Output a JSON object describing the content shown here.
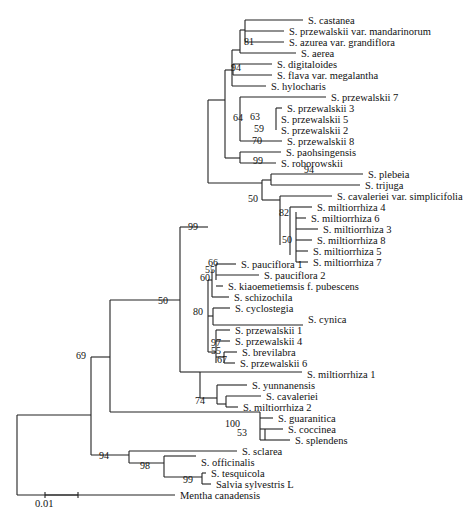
{
  "figure": {
    "type": "phylogenetic-tree",
    "scale_bar": {
      "label": "0.01",
      "x1": 45,
      "x2": 78,
      "y": 495
    }
  },
  "taxa": [
    {
      "name": "S. castanea",
      "x": 306,
      "y": 20
    },
    {
      "name": "S. przewalskii var. mandarinorum",
      "x": 287,
      "y": 31
    },
    {
      "name": "S. azurea var. grandiflora",
      "x": 287,
      "y": 42
    },
    {
      "name": "S. aerea",
      "x": 299,
      "y": 53
    },
    {
      "name": "S. digitaloides",
      "x": 275,
      "y": 64
    },
    {
      "name": "S. flava var. megalantha",
      "x": 275,
      "y": 75
    },
    {
      "name": "S. hylocharis",
      "x": 269,
      "y": 86
    },
    {
      "name": "S. przewalskii 7",
      "x": 329,
      "y": 97
    },
    {
      "name": "S. przewalskii 3",
      "x": 285,
      "y": 108
    },
    {
      "name": "S. przewalskii 5",
      "x": 279,
      "y": 119
    },
    {
      "name": "S. przewalskii 2",
      "x": 279,
      "y": 130
    },
    {
      "name": "S. przewalskii 8",
      "x": 285,
      "y": 141
    },
    {
      "name": "S. paohsingensis",
      "x": 284,
      "y": 152
    },
    {
      "name": "S. roborowskii",
      "x": 279,
      "y": 163
    },
    {
      "name": "S. plebeia",
      "x": 366,
      "y": 174
    },
    {
      "name": "S. trijuga",
      "x": 363,
      "y": 185
    },
    {
      "name": "S. cavaleriei var. simplicifolia",
      "x": 335,
      "y": 196
    },
    {
      "name": "S. miltiorrhiza 4",
      "x": 315,
      "y": 207
    },
    {
      "name": "S. miltiorrhiza 6",
      "x": 309,
      "y": 218
    },
    {
      "name": "S. miltiorrhiza 3",
      "x": 321,
      "y": 229
    },
    {
      "name": "S. miltiorrhiza 8",
      "x": 315,
      "y": 240
    },
    {
      "name": "S. miltiorrhiza 5",
      "x": 311,
      "y": 251
    },
    {
      "name": "S. miltiorrhiza 7",
      "x": 311,
      "y": 262
    },
    {
      "name": "S. pauciflora 1",
      "x": 239,
      "y": 264
    },
    {
      "name": "S. pauciflora 2",
      "x": 262,
      "y": 275
    },
    {
      "name": "S. kiaoemetiemsis f. pubescens",
      "x": 226,
      "y": 286
    },
    {
      "name": "S. schizochila",
      "x": 232,
      "y": 297
    },
    {
      "name": "S. cyclostegia",
      "x": 233,
      "y": 308
    },
    {
      "name": "S. cynica",
      "x": 306,
      "y": 319
    },
    {
      "name": "S. przewalskii 1",
      "x": 233,
      "y": 330
    },
    {
      "name": "S. przewalskii 4",
      "x": 233,
      "y": 341
    },
    {
      "name": "S. brevilabra",
      "x": 240,
      "y": 352
    },
    {
      "name": "S. przewalskii 6",
      "x": 238,
      "y": 363
    },
    {
      "name": "S. miltiorrhiza 1",
      "x": 305,
      "y": 374
    },
    {
      "name": "S. yunnanensis",
      "x": 250,
      "y": 385
    },
    {
      "name": "S. cavaleriei",
      "x": 264,
      "y": 396
    },
    {
      "name": "S. miltiorrhiza 2",
      "x": 241,
      "y": 407
    },
    {
      "name": "S. guaranitica",
      "x": 276,
      "y": 418
    },
    {
      "name": "S. coccinea",
      "x": 286,
      "y": 429
    },
    {
      "name": "S. splendens",
      "x": 293,
      "y": 440
    },
    {
      "name": "S. sclarea",
      "x": 240,
      "y": 451
    },
    {
      "name": "S. officinalis",
      "x": 199,
      "y": 462
    },
    {
      "name": "S. tesquicola",
      "x": 209,
      "y": 473
    },
    {
      "name": "Salvia sylvestris L",
      "x": 214,
      "y": 484
    },
    {
      "name": "Mentha canadensis",
      "x": 178,
      "y": 495
    }
  ],
  "bootstrap": [
    {
      "value": "81",
      "x": 254,
      "y": 42
    },
    {
      "value": "94",
      "x": 241,
      "y": 68
    },
    {
      "value": "64",
      "x": 243,
      "y": 118
    },
    {
      "value": "63",
      "x": 260,
      "y": 117
    },
    {
      "value": "59",
      "x": 264,
      "y": 129
    },
    {
      "value": "70",
      "x": 262,
      "y": 141
    },
    {
      "value": "99",
      "x": 263,
      "y": 161
    },
    {
      "value": "94",
      "x": 314,
      "y": 170
    },
    {
      "value": "50",
      "x": 258,
      "y": 199
    },
    {
      "value": "82",
      "x": 289,
      "y": 213
    },
    {
      "value": "50",
      "x": 292,
      "y": 240
    },
    {
      "value": "99",
      "x": 198,
      "y": 227
    },
    {
      "value": "66",
      "x": 218,
      "y": 263
    },
    {
      "value": "55",
      "x": 215,
      "y": 270
    },
    {
      "value": "60",
      "x": 210,
      "y": 278
    },
    {
      "value": "80",
      "x": 203,
      "y": 312
    },
    {
      "value": "97",
      "x": 221,
      "y": 343
    },
    {
      "value": "55",
      "x": 221,
      "y": 351
    },
    {
      "value": "67",
      "x": 227,
      "y": 360
    },
    {
      "value": "50",
      "x": 168,
      "y": 301
    },
    {
      "value": "69",
      "x": 86,
      "y": 356
    },
    {
      "value": "74",
      "x": 205,
      "y": 401
    },
    {
      "value": "100",
      "x": 240,
      "y": 424
    },
    {
      "value": "53",
      "x": 247,
      "y": 433
    },
    {
      "value": "94",
      "x": 109,
      "y": 456
    },
    {
      "value": "98",
      "x": 150,
      "y": 466
    },
    {
      "value": "99",
      "x": 193,
      "y": 480
    }
  ],
  "branches": [
    [
      17,
      415,
      17,
      495
    ],
    [
      17,
      495,
      175,
      495
    ],
    [
      17,
      415,
      91,
      415
    ],
    [
      91,
      357,
      91,
      455
    ],
    [
      91,
      357,
      110,
      357
    ],
    [
      110,
      300,
      110,
      412
    ],
    [
      110,
      300,
      180,
      300
    ],
    [
      180,
      227,
      180,
      372
    ],
    [
      180,
      227,
      208,
      227
    ],
    [
      208,
      100,
      208,
      183
    ],
    [
      208,
      100,
      225,
      100
    ],
    [
      208,
      183,
      262,
      183
    ],
    [
      225,
      70,
      225,
      158
    ],
    [
      225,
      70,
      232,
      70
    ],
    [
      225,
      158,
      240,
      158
    ],
    [
      232,
      50,
      232,
      86
    ],
    [
      232,
      86,
      266,
      86
    ],
    [
      232,
      50,
      240,
      50
    ],
    [
      240,
      30,
      240,
      53
    ],
    [
      240,
      53,
      296,
      53
    ],
    [
      240,
      30,
      245,
      30
    ],
    [
      245,
      20,
      245,
      42
    ],
    [
      245,
      20,
      303,
      20
    ],
    [
      245,
      31,
      284,
      31
    ],
    [
      245,
      42,
      284,
      42
    ],
    [
      233,
      64,
      233,
      75
    ],
    [
      233,
      64,
      272,
      64
    ],
    [
      233,
      75,
      272,
      75
    ],
    [
      240,
      97,
      240,
      141
    ],
    [
      240,
      97,
      326,
      97
    ],
    [
      240,
      141,
      282,
      141
    ],
    [
      276,
      108,
      276,
      130
    ],
    [
      276,
      108,
      282,
      108
    ],
    [
      276,
      119,
      276,
      119
    ],
    [
      276,
      130,
      276,
      130
    ],
    [
      240,
      152,
      240,
      163
    ],
    [
      240,
      152,
      281,
      152
    ],
    [
      240,
      163,
      276,
      163
    ],
    [
      262,
      180,
      262,
      200
    ],
    [
      262,
      180,
      271,
      180
    ],
    [
      262,
      200,
      280,
      200
    ],
    [
      271,
      174,
      271,
      185
    ],
    [
      271,
      174,
      363,
      174
    ],
    [
      271,
      185,
      360,
      185
    ],
    [
      280,
      196,
      280,
      245
    ],
    [
      280,
      196,
      332,
      196
    ],
    [
      290,
      207,
      290,
      255
    ],
    [
      290,
      207,
      312,
      207
    ],
    [
      296,
      218,
      306,
      218
    ],
    [
      296,
      229,
      318,
      229
    ],
    [
      296,
      240,
      312,
      240
    ],
    [
      296,
      251,
      308,
      251
    ],
    [
      296,
      262,
      308,
      262
    ],
    [
      296,
      212,
      296,
      262
    ],
    [
      208,
      280,
      208,
      352
    ],
    [
      208,
      280,
      212,
      280
    ],
    [
      212,
      270,
      212,
      297
    ],
    [
      212,
      297,
      229,
      297
    ],
    [
      216,
      264,
      216,
      280
    ],
    [
      216,
      264,
      236,
      264
    ],
    [
      216,
      275,
      259,
      275
    ],
    [
      216,
      286,
      223,
      286
    ],
    [
      208,
      316,
      213,
      316
    ],
    [
      213,
      308,
      213,
      325
    ],
    [
      213,
      308,
      230,
      308
    ],
    [
      213,
      325,
      303,
      325
    ],
    [
      208,
      352,
      216,
      352
    ],
    [
      216,
      330,
      216,
      363
    ],
    [
      216,
      330,
      230,
      330
    ],
    [
      216,
      341,
      230,
      341
    ],
    [
      216,
      357,
      224,
      357
    ],
    [
      224,
      352,
      224,
      363
    ],
    [
      224,
      352,
      237,
      352
    ],
    [
      224,
      363,
      235,
      363
    ],
    [
      180,
      372,
      200,
      372
    ],
    [
      200,
      372,
      200,
      398
    ],
    [
      200,
      372,
      302,
      372
    ],
    [
      200,
      398,
      217,
      398
    ],
    [
      217,
      385,
      217,
      404
    ],
    [
      217,
      385,
      247,
      385
    ],
    [
      217,
      404,
      226,
      404
    ],
    [
      226,
      396,
      226,
      407
    ],
    [
      226,
      396,
      261,
      396
    ],
    [
      226,
      407,
      238,
      407
    ],
    [
      110,
      412,
      260,
      412
    ],
    [
      260,
      412,
      260,
      440
    ],
    [
      260,
      418,
      273,
      418
    ],
    [
      260,
      429,
      283,
      429
    ],
    [
      260,
      440,
      290,
      440
    ],
    [
      265,
      429,
      265,
      440
    ],
    [
      91,
      455,
      129,
      455
    ],
    [
      129,
      451,
      129,
      463
    ],
    [
      129,
      451,
      237,
      451
    ],
    [
      129,
      463,
      164,
      463
    ],
    [
      164,
      456,
      164,
      477
    ],
    [
      164,
      456,
      196,
      456
    ],
    [
      164,
      477,
      202,
      477
    ],
    [
      202,
      473,
      202,
      484
    ],
    [
      202,
      473,
      206,
      473
    ],
    [
      202,
      484,
      211,
      484
    ]
  ]
}
